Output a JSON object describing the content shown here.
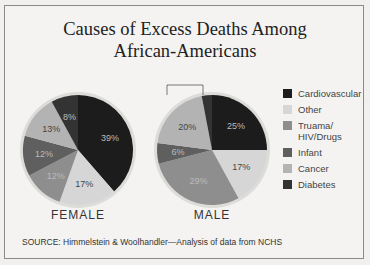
{
  "title_line1": "Causes of Excess Deaths Among",
  "title_line2": "African-Americans",
  "source": "SOURCE: Himmelstein & Woolhandler—Analysis of data from NCHS",
  "colors": {
    "Cardiovascular": "#1c1c1c",
    "Other": "#d6d6d6",
    "Truama/HIV/Drugs": "#8e8e8e",
    "Infant": "#5f5f5f",
    "Cancer": "#b3b3b3",
    "Diabetes": "#333333"
  },
  "legend": [
    {
      "label": "Cardiovascular",
      "color": "#1c1c1c"
    },
    {
      "label": "Other",
      "color": "#d6d6d6"
    },
    {
      "label": "Truama/\nHIV/Drugs",
      "color": "#8e8e8e"
    },
    {
      "label": "Infant",
      "color": "#5f5f5f"
    },
    {
      "label": "Cancer",
      "color": "#b3b3b3"
    },
    {
      "label": "Diabetes",
      "color": "#333333"
    }
  ],
  "chart_data": [
    {
      "type": "pie",
      "title": "FEMALE",
      "categories": [
        "Cardiovascular",
        "Other",
        "Truama/HIV/Drugs",
        "Infant",
        "Cancer",
        "Diabetes"
      ],
      "values": [
        39,
        17,
        12,
        12,
        13,
        8
      ],
      "labels": [
        "39%",
        "17%",
        "12%",
        "12%",
        "13%",
        "8%"
      ]
    },
    {
      "type": "pie",
      "title": "MALE",
      "categories": [
        "Cardiovascular",
        "Other",
        "Truama/HIV/Drugs",
        "Infant",
        "Cancer",
        "Diabetes"
      ],
      "values": [
        25,
        17,
        29,
        6,
        20,
        3
      ],
      "labels": [
        "25%",
        "17%",
        "29%",
        "6%",
        "20%",
        "3%"
      ]
    }
  ],
  "pie_labels": {
    "female": "FEMALE",
    "male": "MALE"
  }
}
